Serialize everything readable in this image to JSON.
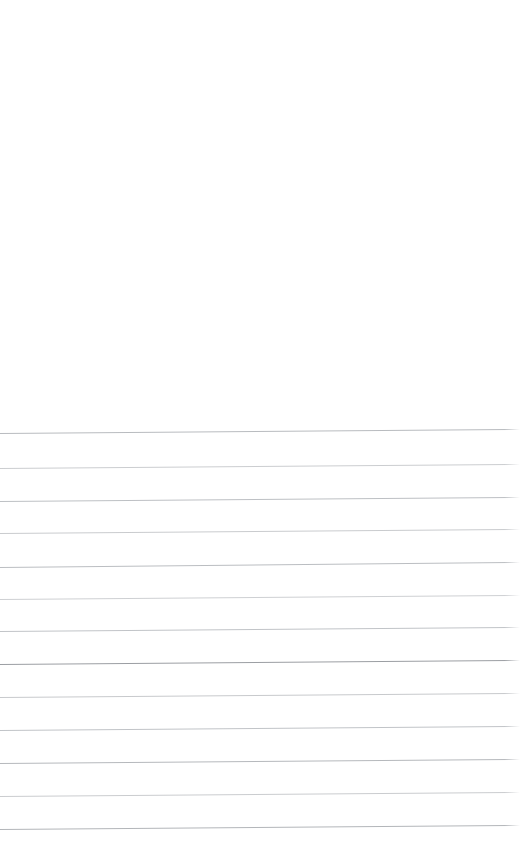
{
  "page": {
    "name": "blank-ruled-paper-scan",
    "width": 520,
    "height": 865,
    "background_color": "#ffffff",
    "visible_text": ""
  },
  "blank_area": {
    "top": 0,
    "height": 428,
    "color": "#ffffff"
  },
  "bottom_margin": {
    "height": 34,
    "color": "#ffffff"
  },
  "ruling": {
    "line_count": 13,
    "full_width": true,
    "left_x": 0,
    "right_x": 520,
    "average_spacing": 32.6,
    "tilt_px": -4,
    "default_color": "#c3c5c8",
    "lines": [
      {
        "index": 1,
        "y_left": 433,
        "y_right": 429,
        "color": "#b4b7bb",
        "thickness": 1
      },
      {
        "index": 2,
        "y_left": 468,
        "y_right": 464,
        "color": "#c8cacd",
        "thickness": 1
      },
      {
        "index": 3,
        "y_left": 501,
        "y_right": 497,
        "color": "#b9bcc0",
        "thickness": 1
      },
      {
        "index": 4,
        "y_left": 533,
        "y_right": 529,
        "color": "#c6c8cb",
        "thickness": 1
      },
      {
        "index": 5,
        "y_left": 567,
        "y_right": 562,
        "color": "#b7babe",
        "thickness": 1
      },
      {
        "index": 6,
        "y_left": 599,
        "y_right": 595,
        "color": "#cbcdd0",
        "thickness": 1
      },
      {
        "index": 7,
        "y_left": 631,
        "y_right": 627,
        "color": "#bdc0c4",
        "thickness": 1
      },
      {
        "index": 8,
        "y_left": 664,
        "y_right": 660,
        "color": "#95989d",
        "thickness": 1
      },
      {
        "index": 9,
        "y_left": 697,
        "y_right": 693,
        "color": "#c4c6c9",
        "thickness": 1
      },
      {
        "index": 10,
        "y_left": 730,
        "y_right": 726,
        "color": "#bdc0c4",
        "thickness": 1
      },
      {
        "index": 11,
        "y_left": 763,
        "y_right": 759,
        "color": "#b1b4b8",
        "thickness": 1
      },
      {
        "index": 12,
        "y_left": 796,
        "y_right": 792,
        "color": "#c7c9cc",
        "thickness": 1
      },
      {
        "index": 13,
        "y_left": 829,
        "y_right": 825,
        "color": "#aeb1b5",
        "thickness": 1
      }
    ]
  }
}
